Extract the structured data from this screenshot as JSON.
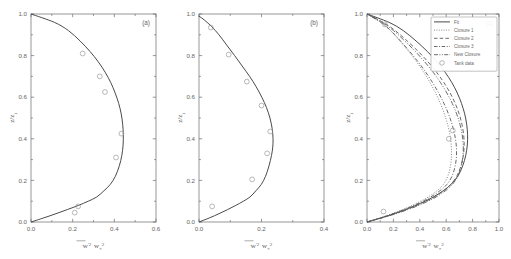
{
  "figure": {
    "background_color": "#ffffff",
    "line_color": "#4a4a4a",
    "axis_color": "#6b6b6b",
    "marker_color": "#9a9a9a"
  },
  "axis_titles": {
    "x_variable": "w",
    "x_prime": "'",
    "x_exponent": "2",
    "x_divider": "",
    "x_denominator": "w",
    "x_denominator_sub": "*",
    "x_denominator_exp": "2",
    "y_label": "z/z",
    "y_label_sub": "i"
  },
  "chart_data": [
    {
      "type": "line",
      "panel": "(a)",
      "title": "",
      "xlabel": "w'² / w*²",
      "ylabel": "z/z_i",
      "xlim": [
        0.0,
        0.6
      ],
      "ylim": [
        0.0,
        1.0
      ],
      "xticks": [
        0.0,
        0.2,
        0.4,
        0.6
      ],
      "xticklabels": [
        "0.0",
        "0.2",
        "0.4",
        "0.6"
      ],
      "yticks": [
        0.0,
        0.2,
        0.4,
        0.6,
        0.8,
        1.0
      ],
      "yticklabels": [
        "0.0",
        "0.2",
        "0.4",
        "0.6",
        "0.8",
        "1.0"
      ],
      "grid": false,
      "legend": false,
      "series": [
        {
          "name": "Fit",
          "style": "solid",
          "x": [
            0.0,
            0.062,
            0.12,
            0.175,
            0.228,
            0.275,
            0.315,
            0.35,
            0.38,
            0.405,
            0.424,
            0.436,
            0.442,
            0.443,
            0.44,
            0.433,
            0.421,
            0.404,
            0.383,
            0.356,
            0.323,
            0.283,
            0.236,
            0.18,
            0.112,
            0.0
          ],
          "y": [
            0.0,
            0.02,
            0.04,
            0.06,
            0.08,
            0.1,
            0.12,
            0.15,
            0.18,
            0.22,
            0.27,
            0.32,
            0.37,
            0.42,
            0.47,
            0.52,
            0.57,
            0.62,
            0.67,
            0.72,
            0.77,
            0.82,
            0.87,
            0.92,
            0.96,
            1.0
          ]
        },
        {
          "name": "Tank data",
          "style": "circles",
          "x": [
            0.21,
            0.226,
            0.408,
            0.434,
            0.355,
            0.33,
            0.248
          ],
          "y": [
            0.045,
            0.075,
            0.31,
            0.425,
            0.625,
            0.7,
            0.81
          ]
        }
      ]
    },
    {
      "type": "line",
      "panel": "(b)",
      "title": "",
      "xlabel": "w'² / w*²",
      "ylabel": "z/z_i",
      "xlim": [
        0.0,
        0.4
      ],
      "ylim": [
        0.0,
        1.0
      ],
      "xticks": [
        0.0,
        0.2,
        0.4
      ],
      "xticklabels": [
        "0.0",
        "0.2",
        "0.4"
      ],
      "yticks": [
        0.0,
        0.2,
        0.4,
        0.6,
        0.8,
        1.0
      ],
      "yticklabels": [
        "0.0",
        "0.2",
        "0.4",
        "0.6",
        "0.8",
        "1.0"
      ],
      "grid": false,
      "legend": false,
      "series": [
        {
          "name": "Fit",
          "style": "solid",
          "x": [
            0.0,
            0.034,
            0.064,
            0.092,
            0.118,
            0.142,
            0.163,
            0.182,
            0.199,
            0.213,
            0.224,
            0.232,
            0.236,
            0.237,
            0.234,
            0.227,
            0.216,
            0.201,
            0.183,
            0.162,
            0.138,
            0.114,
            0.089,
            0.064,
            0.04,
            0.018,
            0.0
          ],
          "y": [
            0.0,
            0.02,
            0.04,
            0.06,
            0.08,
            0.1,
            0.12,
            0.15,
            0.18,
            0.22,
            0.27,
            0.32,
            0.36,
            0.4,
            0.45,
            0.5,
            0.55,
            0.6,
            0.65,
            0.7,
            0.75,
            0.8,
            0.85,
            0.9,
            0.94,
            0.97,
            0.99
          ]
        },
        {
          "name": "Tank data",
          "style": "circles",
          "x": [
            0.042,
            0.17,
            0.218,
            0.228,
            0.2,
            0.153,
            0.095,
            0.038
          ],
          "y": [
            0.075,
            0.205,
            0.33,
            0.435,
            0.56,
            0.675,
            0.805,
            0.935
          ]
        }
      ]
    },
    {
      "type": "line",
      "panel": "(c)",
      "title": "",
      "xlabel": "w'² / w*²",
      "ylabel": "z/z_i",
      "xlim": [
        0.0,
        1.0
      ],
      "ylim": [
        0.0,
        1.0
      ],
      "xticks": [
        0.0,
        0.2,
        0.4,
        0.6,
        0.8,
        1.0
      ],
      "xticklabels": [
        "0.0",
        "0.2",
        "0.4",
        "0.6",
        "0.8",
        "1.0"
      ],
      "yticks": [
        0.0,
        0.2,
        0.4,
        0.6,
        0.8,
        1.0
      ],
      "yticklabels": [
        "0.0",
        "0.2",
        "0.4",
        "0.6",
        "0.8",
        "1.0"
      ],
      "grid": false,
      "legend": true,
      "legend_position": "upper right",
      "series": [
        {
          "name": "Fit",
          "style": "solid",
          "x": [
            0.0,
            0.108,
            0.205,
            0.292,
            0.37,
            0.44,
            0.502,
            0.577,
            0.635,
            0.688,
            0.725,
            0.748,
            0.76,
            0.762,
            0.755,
            0.74,
            0.716,
            0.684,
            0.643,
            0.592,
            0.53,
            0.457,
            0.372,
            0.275,
            0.166,
            0.0
          ],
          "y": [
            0.0,
            0.02,
            0.04,
            0.06,
            0.08,
            0.1,
            0.12,
            0.15,
            0.18,
            0.22,
            0.27,
            0.32,
            0.37,
            0.42,
            0.47,
            0.52,
            0.57,
            0.62,
            0.67,
            0.72,
            0.77,
            0.82,
            0.87,
            0.92,
            0.96,
            1.0
          ]
        },
        {
          "name": "Closure 1",
          "style": "dotted",
          "x": [
            0.0,
            0.1,
            0.19,
            0.27,
            0.342,
            0.406,
            0.463,
            0.53,
            0.578,
            0.612,
            0.632,
            0.64,
            0.638,
            0.628,
            0.61,
            0.586,
            0.556,
            0.52,
            0.478,
            0.43,
            0.376,
            0.316,
            0.25,
            0.178,
            0.104,
            0.0
          ],
          "y": [
            0.0,
            0.02,
            0.04,
            0.06,
            0.08,
            0.1,
            0.12,
            0.15,
            0.18,
            0.22,
            0.27,
            0.32,
            0.37,
            0.42,
            0.47,
            0.52,
            0.57,
            0.62,
            0.67,
            0.72,
            0.77,
            0.82,
            0.87,
            0.92,
            0.96,
            1.0
          ]
        },
        {
          "name": "Closure 2",
          "style": "dashed",
          "x": [
            0.0,
            0.112,
            0.212,
            0.3,
            0.378,
            0.447,
            0.508,
            0.58,
            0.634,
            0.68,
            0.712,
            0.73,
            0.736,
            0.732,
            0.719,
            0.698,
            0.668,
            0.63,
            0.583,
            0.527,
            0.462,
            0.388,
            0.305,
            0.214,
            0.122,
            0.0
          ],
          "y": [
            0.0,
            0.02,
            0.04,
            0.06,
            0.08,
            0.1,
            0.12,
            0.15,
            0.18,
            0.22,
            0.27,
            0.32,
            0.37,
            0.42,
            0.47,
            0.52,
            0.57,
            0.62,
            0.67,
            0.72,
            0.77,
            0.82,
            0.87,
            0.92,
            0.96,
            1.0
          ]
        },
        {
          "name": "Closure 3",
          "style": "dashdot",
          "x": [
            0.0,
            0.104,
            0.198,
            0.282,
            0.357,
            0.423,
            0.482,
            0.552,
            0.604,
            0.644,
            0.668,
            0.678,
            0.676,
            0.664,
            0.644,
            0.617,
            0.583,
            0.543,
            0.497,
            0.445,
            0.387,
            0.323,
            0.254,
            0.18,
            0.104,
            0.0
          ],
          "y": [
            0.0,
            0.02,
            0.04,
            0.06,
            0.08,
            0.1,
            0.12,
            0.15,
            0.18,
            0.22,
            0.27,
            0.32,
            0.37,
            0.42,
            0.47,
            0.52,
            0.57,
            0.62,
            0.67,
            0.72,
            0.77,
            0.82,
            0.87,
            0.92,
            0.96,
            1.0
          ]
        },
        {
          "name": "New Closure",
          "style": "dashdotdot",
          "x": [
            0.0,
            0.116,
            0.22,
            0.312,
            0.392,
            0.462,
            0.523,
            0.594,
            0.646,
            0.688,
            0.714,
            0.727,
            0.729,
            0.721,
            0.704,
            0.679,
            0.646,
            0.605,
            0.557,
            0.501,
            0.437,
            0.366,
            0.287,
            0.201,
            0.114,
            0.0
          ],
          "y": [
            0.0,
            0.02,
            0.04,
            0.06,
            0.08,
            0.1,
            0.12,
            0.15,
            0.18,
            0.22,
            0.27,
            0.32,
            0.37,
            0.42,
            0.47,
            0.52,
            0.57,
            0.62,
            0.67,
            0.72,
            0.77,
            0.82,
            0.87,
            0.92,
            0.96,
            1.0
          ]
        },
        {
          "name": "Tank data",
          "style": "circles",
          "x": [
            0.125,
            0.62,
            0.65,
            0.135
          ],
          "y": [
            0.05,
            0.4,
            0.44,
            0.95
          ]
        }
      ],
      "legend_entries": [
        {
          "label": "Fit",
          "style": "solid"
        },
        {
          "label": "Closure 1",
          "style": "dotted"
        },
        {
          "label": "Closure 2",
          "style": "dashed"
        },
        {
          "label": "Closure 3",
          "style": "dashdot"
        },
        {
          "label": "New Closure",
          "style": "dashdotdot"
        },
        {
          "label": "Tank data",
          "style": "circles"
        }
      ]
    }
  ]
}
